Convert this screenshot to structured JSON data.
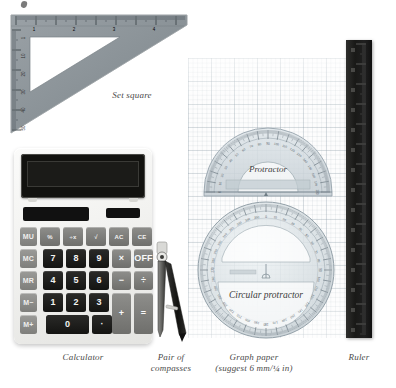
{
  "page": {
    "background_color": "#ffffff",
    "width": 396,
    "height": 388
  },
  "captions": {
    "set_square": "Set square",
    "calculator": "Calculator",
    "compasses_line1": "Pair of",
    "compasses_line2": "compasses",
    "graph_paper_line1": "Graph paper",
    "graph_paper_line2": "(suggest 6 mm/¼ in)",
    "ruler": "Ruler"
  },
  "labels": {
    "protractor": "Protractor",
    "circular_protractor": "Circular protractor"
  },
  "calculator": {
    "display_value": "",
    "keys": [
      [
        {
          "label": "MU",
          "type": "mem"
        },
        {
          "label": "%",
          "type": "fn"
        },
        {
          "label": "÷x",
          "type": "fn"
        },
        {
          "label": "√",
          "type": "fn"
        },
        {
          "label": "AC",
          "type": "fn"
        },
        {
          "label": "CE",
          "type": "fn"
        }
      ],
      [
        {
          "label": "MC",
          "type": "mem"
        },
        {
          "label": "7",
          "type": "num"
        },
        {
          "label": "8",
          "type": "num"
        },
        {
          "label": "9",
          "type": "num"
        },
        {
          "label": "×",
          "type": "op"
        },
        {
          "label": "OFF",
          "type": "op"
        }
      ],
      [
        {
          "label": "MR",
          "type": "mem"
        },
        {
          "label": "4",
          "type": "num"
        },
        {
          "label": "5",
          "type": "num"
        },
        {
          "label": "6",
          "type": "num"
        },
        {
          "label": "−",
          "type": "op"
        },
        {
          "label": "÷",
          "type": "op"
        }
      ],
      [
        {
          "label": "M−",
          "type": "mem"
        },
        {
          "label": "1",
          "type": "num"
        },
        {
          "label": "2",
          "type": "num"
        },
        {
          "label": "3",
          "type": "num"
        },
        {
          "label": "+",
          "type": "op"
        },
        {
          "label": "=",
          "type": "op"
        }
      ],
      [
        {
          "label": "M+",
          "type": "mem"
        },
        {
          "label": "0",
          "type": "zero"
        },
        {
          "label": "·",
          "type": "dot"
        }
      ]
    ]
  },
  "set_square": {
    "ruler_top_numbers": [
      "1",
      "2",
      "3",
      "4"
    ],
    "ruler_left_numbers": [
      "1",
      "10",
      "20",
      "30",
      "40",
      "50"
    ]
  },
  "protractor_scale": {
    "major_step_degrees": 10,
    "semicircle_range": [
      0,
      180
    ],
    "circle_range": [
      0,
      360
    ]
  },
  "colors": {
    "paper": "#ffffff",
    "graph_grid": "#96a5af",
    "set_square_body": "#8c9499",
    "calculator_body": "#f2f2f0",
    "calculator_screen": "#12120f",
    "ruler_body": "#191917",
    "protractor_tint": "#c9d2d6",
    "caption_text": "#4a4a4a"
  }
}
